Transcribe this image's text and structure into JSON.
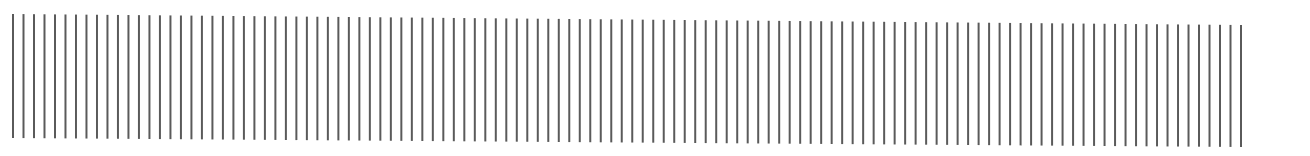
{
  "pattern": {
    "type": "vertical-lines",
    "line_count": 118,
    "first_x": 13,
    "last_x": 1241,
    "top_left_y": 14,
    "top_right_y": 25,
    "bottom_left_y": 138,
    "bottom_right_y": 147,
    "line_width": 2,
    "line_color": "#5a5a5a",
    "background_color": "#ffffff"
  }
}
